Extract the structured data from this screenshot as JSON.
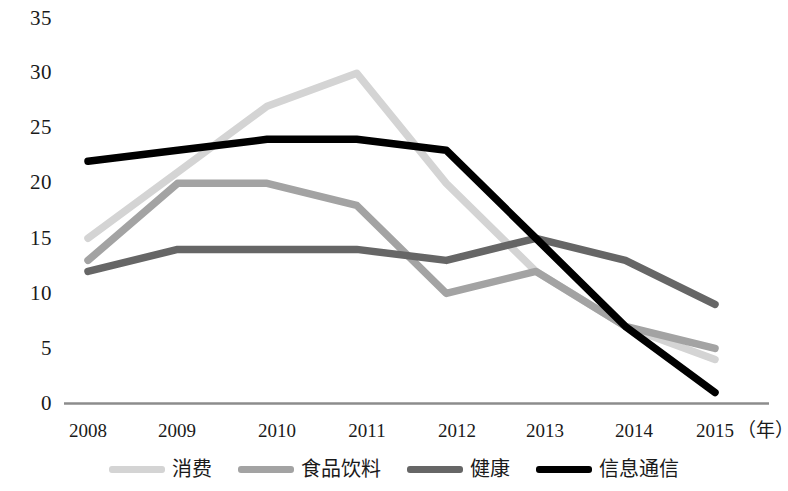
{
  "chart_data": {
    "type": "line",
    "title": "",
    "subtitle": "",
    "xlabel": "（年）",
    "ylabel": "",
    "x": [
      "2008",
      "2009",
      "2010",
      "2011",
      "2012",
      "2013",
      "2014",
      "2015"
    ],
    "categories": [
      "2008",
      "2009",
      "2010",
      "2011",
      "2012",
      "2013",
      "2014",
      "2015"
    ],
    "xlim": [
      2008,
      2015
    ],
    "ylim": [
      0,
      35
    ],
    "yticks": [
      "0",
      "5",
      "10",
      "15",
      "20",
      "25",
      "30",
      "35"
    ],
    "ytick_values": [
      0,
      5,
      10,
      15,
      20,
      25,
      30,
      35
    ],
    "grid": false,
    "legend_position": "bottom",
    "series": [
      {
        "name": "消费",
        "color": "#d4d4d4",
        "values": [
          15,
          21,
          27,
          30,
          20,
          12,
          7,
          4
        ]
      },
      {
        "name": "食品饮料",
        "color": "#a3a3a3",
        "values": [
          13,
          20,
          20,
          18,
          10,
          12,
          7,
          5
        ]
      },
      {
        "name": "健康",
        "color": "#666666",
        "values": [
          12,
          14,
          14,
          14,
          13,
          15,
          13,
          9
        ]
      },
      {
        "name": "信息通信",
        "color": "#000000",
        "values": [
          22,
          23,
          24,
          24,
          23,
          15,
          7,
          1
        ]
      }
    ]
  },
  "axis": {
    "unit_label": "（年）"
  },
  "legend": {
    "items": [
      {
        "label": "消费",
        "color": "#d4d4d4"
      },
      {
        "label": "食品饮料",
        "color": "#a3a3a3"
      },
      {
        "label": "健康",
        "color": "#666666"
      },
      {
        "label": "信息通信",
        "color": "#000000"
      }
    ]
  },
  "colors": {
    "axis_line": "#8c8c8c",
    "background": "#ffffff",
    "text": "#1a1a1a"
  }
}
